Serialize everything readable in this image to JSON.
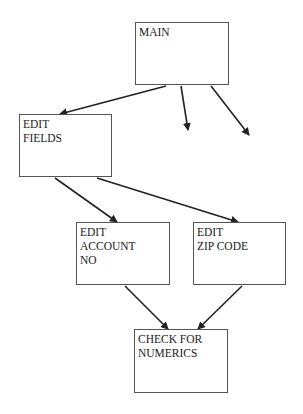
{
  "diagram": {
    "type": "structure-chart",
    "nodes": [
      {
        "id": "main",
        "label": "MAIN",
        "x": 135,
        "y": 22,
        "w": 94,
        "h": 63
      },
      {
        "id": "edit_fields",
        "label": "EDIT\nFIELDS",
        "x": 19,
        "y": 114,
        "w": 93,
        "h": 63
      },
      {
        "id": "edit_account",
        "label": "EDIT\nACCOUNT\nNO",
        "x": 76,
        "y": 222,
        "w": 94,
        "h": 63
      },
      {
        "id": "edit_zip",
        "label": "EDIT\nZIP CODE",
        "x": 193,
        "y": 222,
        "w": 93,
        "h": 63
      },
      {
        "id": "check_numerics",
        "label": "CHECK FOR\nNUMERICS",
        "x": 134,
        "y": 329,
        "w": 94,
        "h": 64
      }
    ],
    "edges": [
      {
        "from": "main",
        "to": "edit_fields",
        "x1": 166,
        "y1": 86,
        "x2": 60,
        "y2": 114
      },
      {
        "from": "main",
        "to": "unlabeled-1",
        "x1": 181,
        "y1": 86,
        "x2": 188,
        "y2": 130
      },
      {
        "from": "main",
        "to": "unlabeled-2",
        "x1": 211,
        "y1": 86,
        "x2": 249,
        "y2": 135
      },
      {
        "from": "edit_fields",
        "to": "edit_account",
        "x1": 55,
        "y1": 178,
        "x2": 117,
        "y2": 222
      },
      {
        "from": "edit_fields",
        "to": "edit_zip",
        "x1": 97,
        "y1": 178,
        "x2": 238,
        "y2": 222
      },
      {
        "from": "edit_account",
        "to": "check_numerics",
        "x1": 125,
        "y1": 286,
        "x2": 168,
        "y2": 329
      },
      {
        "from": "edit_zip",
        "to": "check_numerics",
        "x1": 242,
        "y1": 286,
        "x2": 198,
        "y2": 329
      }
    ]
  }
}
